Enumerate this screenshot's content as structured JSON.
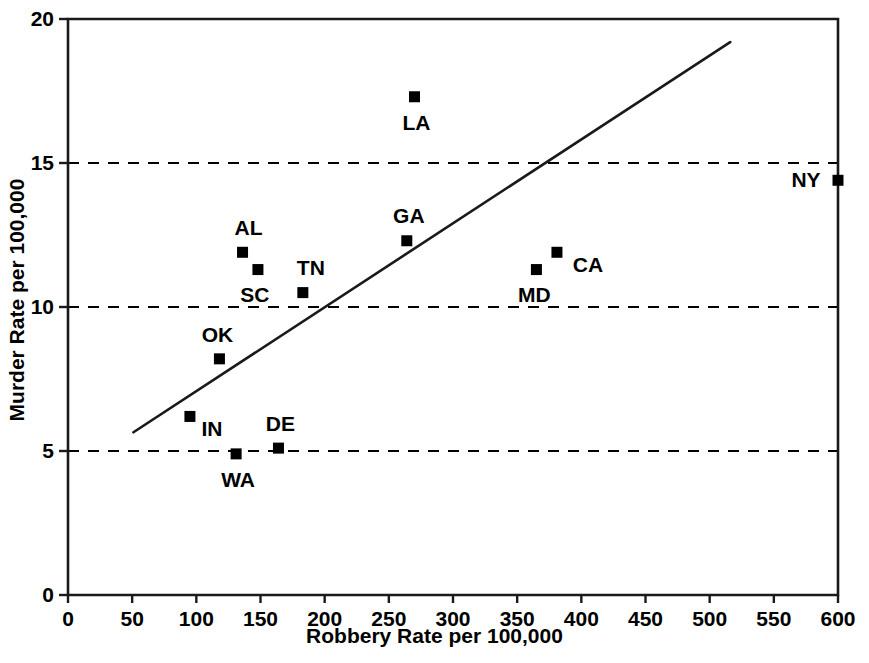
{
  "chart_data": {
    "type": "scatter",
    "title": "",
    "xlabel": "Robbery Rate per 100,000",
    "ylabel": "Murder Rate per 100,000",
    "xlim": [
      0,
      600
    ],
    "ylim": [
      0,
      20
    ],
    "xticks": [
      0,
      50,
      100,
      150,
      200,
      250,
      300,
      350,
      400,
      450,
      500,
      550,
      600
    ],
    "xticklabels": [
      "0",
      "50",
      "100",
      "150",
      "200",
      "250",
      "300",
      "350",
      "400",
      "450",
      "500",
      "550",
      "600"
    ],
    "yticks": [
      0,
      5,
      10,
      15,
      20
    ],
    "yticklabels": [
      "0",
      "5",
      "10",
      "15",
      "20"
    ],
    "grid": "horizontal-dashed-at-5-10-15",
    "legend": null,
    "marker": "filled-square",
    "marker_color": "#000000",
    "points": [
      {
        "label": "IN",
        "x": 95,
        "y": 6.2,
        "label_dx": 22,
        "label_dy": 13
      },
      {
        "label": "OK",
        "x": 118,
        "y": 8.2,
        "label_dx": -2,
        "label_dy": -24
      },
      {
        "label": "WA",
        "x": 131,
        "y": 4.9,
        "label_dx": 2,
        "label_dy": 26
      },
      {
        "label": "AL",
        "x": 136,
        "y": 11.9,
        "label_dx": 6,
        "label_dy": -24
      },
      {
        "label": "SC",
        "x": 148,
        "y": 11.3,
        "label_dx": -3,
        "label_dy": 25
      },
      {
        "label": "DE",
        "x": 164,
        "y": 5.1,
        "label_dx": 2,
        "label_dy": -24
      },
      {
        "label": "TN",
        "x": 183,
        "y": 10.5,
        "label_dx": 8,
        "label_dy": -25
      },
      {
        "label": "GA",
        "x": 264,
        "y": 12.3,
        "label_dx": 2,
        "label_dy": -25
      },
      {
        "label": "LA",
        "x": 270,
        "y": 17.3,
        "label_dx": 2,
        "label_dy": 26
      },
      {
        "label": "MD",
        "x": 365,
        "y": 11.3,
        "label_dx": -2,
        "label_dy": 25
      },
      {
        "label": "CA",
        "x": 381,
        "y": 11.9,
        "label_dx": 31,
        "label_dy": 13
      },
      {
        "label": "NY",
        "x": 600,
        "y": 14.4,
        "label_dx": -32,
        "label_dy": 0
      }
    ],
    "trend_line": {
      "type": "linear-fit",
      "x_start": 51,
      "y_start": 5.65,
      "x_end": 516,
      "y_end": 19.2
    }
  },
  "axis": {
    "frame_color": "#1a1a1a",
    "gridline_color": "#000000"
  }
}
